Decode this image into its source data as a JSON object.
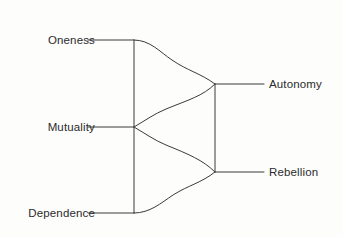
{
  "diagram": {
    "background_color": "#fdfdfc",
    "line_color": "#3a3a3a",
    "text_color": "#2b2b2b",
    "left_nodes": [
      {
        "id": "oneness",
        "label": "Oneness",
        "x": 134,
        "y": 40
      },
      {
        "id": "mutuality",
        "label": "Mutuality",
        "x": 134,
        "y": 127
      },
      {
        "id": "dependence",
        "label": "Dependence",
        "x": 134,
        "y": 213
      }
    ],
    "right_nodes": [
      {
        "id": "autonomy",
        "label": "Autonomy",
        "x": 215,
        "y": 84
      },
      {
        "id": "rebellion",
        "label": "Rebellion",
        "x": 215,
        "y": 172
      }
    ],
    "connections": [
      {
        "from": "oneness",
        "to": "autonomy"
      },
      {
        "from": "mutuality",
        "to": "autonomy"
      },
      {
        "from": "mutuality",
        "to": "rebellion"
      },
      {
        "from": "dependence",
        "to": "rebellion"
      }
    ]
  }
}
